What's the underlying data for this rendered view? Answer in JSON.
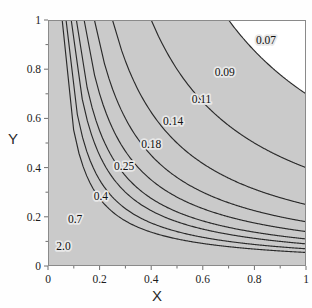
{
  "chart_data": {
    "type": "line",
    "subtype": "contour",
    "title": "",
    "xlabel": "X",
    "ylabel": "Y",
    "xlim": [
      0,
      1
    ],
    "ylim": [
      0,
      1
    ],
    "xticks": [
      "0",
      "0.2",
      "0.4",
      "0.6",
      "0.8",
      "1"
    ],
    "xtick_values": [
      0,
      0.2,
      0.4,
      0.6,
      0.8,
      1
    ],
    "yticks": [
      "0",
      "0.2",
      "0.4",
      "0.6",
      "0.8",
      "1"
    ],
    "ytick_values": [
      0,
      0.2,
      0.4,
      0.6,
      0.8,
      1
    ],
    "grid": false,
    "legend": "none",
    "function": "hyperbolic contours of form y = level / x",
    "levels": [
      0.07,
      0.09,
      0.11,
      0.14,
      0.18,
      0.25,
      0.4,
      0.7,
      2.0
    ],
    "contour_labels": [
      "0.07",
      "0.09",
      "0.11",
      "0.14",
      "0.18",
      "0.25",
      "0.4",
      "0.7",
      "2.0"
    ],
    "fill": "grayscale bands, darker toward origin (lower-left), lightest toward upper-right",
    "contours": [
      {
        "label": "2.0",
        "level": 2.0,
        "label_x": 0.06,
        "label_y": 0.075
      },
      {
        "label": "0.7",
        "level": 0.7,
        "label_x": 0.105,
        "label_y": 0.185
      },
      {
        "label": "0.4",
        "level": 0.4,
        "label_x": 0.205,
        "label_y": 0.28
      },
      {
        "label": "0.25",
        "level": 0.25,
        "label_x": 0.295,
        "label_y": 0.4
      },
      {
        "label": "0.18",
        "level": 0.18,
        "label_x": 0.4,
        "label_y": 0.49
      },
      {
        "label": "0.14",
        "level": 0.14,
        "label_x": 0.485,
        "label_y": 0.585
      },
      {
        "label": "0.11",
        "level": 0.11,
        "label_x": 0.595,
        "label_y": 0.675
      },
      {
        "label": "0.09",
        "level": 0.09,
        "label_x": 0.685,
        "label_y": 0.785
      },
      {
        "label": "0.07",
        "level": 0.07,
        "label_x": 0.845,
        "label_y": 0.915
      }
    ],
    "band_colors": [
      "#ffffff",
      "#f7f7f7",
      "#f1f1f1",
      "#ebebeb",
      "#e4e4e4",
      "#dedede",
      "#d8d8d8",
      "#d2d2d2",
      "#cacaca",
      "#c2c2c2",
      "#b8b8b8"
    ],
    "line_color": "#2a2a2a",
    "frame_color": "#8a8a8a"
  }
}
